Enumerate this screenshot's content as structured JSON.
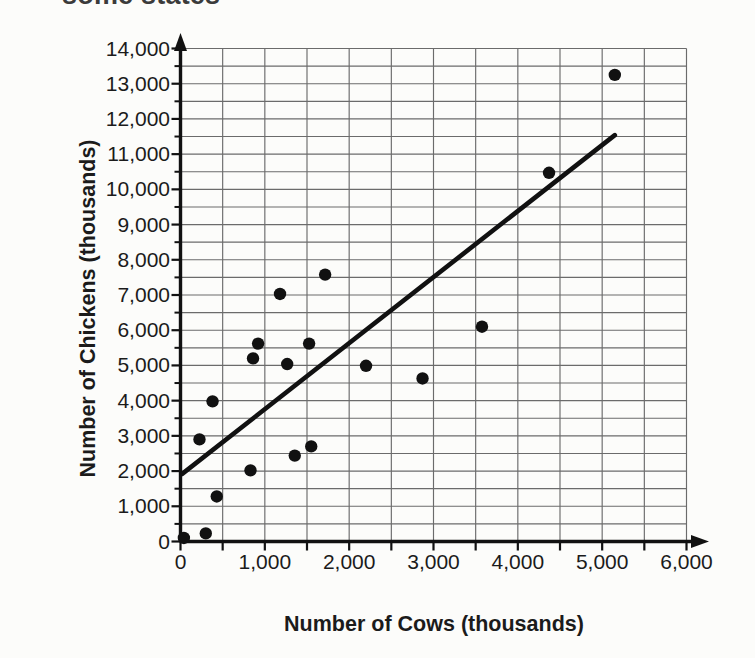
{
  "caption": {
    "text": "some states"
  },
  "chart_data": {
    "type": "scatter",
    "title": "",
    "xlabel": "Number of Cows (thousands)",
    "ylabel": "Number of Chickens (thousands)",
    "xlim": [
      0,
      6000
    ],
    "ylim": [
      0,
      14000
    ],
    "x_major_step": 1000,
    "y_major_step": 1000,
    "x_minor_step": 500,
    "y_minor_step": 500,
    "grid": true,
    "grid_x_step": 500,
    "grid_y_step": 500,
    "legend": "none",
    "x_tick_labels": [
      "0",
      "1,000",
      "2,000",
      "3,000",
      "4,000",
      "5,000",
      "6,000"
    ],
    "x_tick_values": [
      0,
      1000,
      2000,
      3000,
      4000,
      5000,
      6000
    ],
    "y_tick_labels": [
      "0",
      "1,000",
      "2,000",
      "3,000",
      "4,000",
      "5,000",
      "6,000",
      "7,000",
      "8,000",
      "9,000",
      "10,000",
      "11,000",
      "12,000",
      "13,000",
      "14,000"
    ],
    "y_tick_values": [
      0,
      1000,
      2000,
      3000,
      4000,
      5000,
      6000,
      7000,
      8000,
      9000,
      10000,
      11000,
      12000,
      13000,
      14000
    ],
    "points": [
      {
        "x": 40,
        "y": 100
      },
      {
        "x": 300,
        "y": 230
      },
      {
        "x": 225,
        "y": 2900
      },
      {
        "x": 430,
        "y": 1280
      },
      {
        "x": 380,
        "y": 3980
      },
      {
        "x": 830,
        "y": 2020
      },
      {
        "x": 860,
        "y": 5200
      },
      {
        "x": 920,
        "y": 5620
      },
      {
        "x": 1180,
        "y": 7030
      },
      {
        "x": 1265,
        "y": 5040
      },
      {
        "x": 1355,
        "y": 2440
      },
      {
        "x": 1525,
        "y": 5620
      },
      {
        "x": 1550,
        "y": 2700
      },
      {
        "x": 1715,
        "y": 7580
      },
      {
        "x": 2200,
        "y": 4990
      },
      {
        "x": 2870,
        "y": 4630
      },
      {
        "x": 3575,
        "y": 6100
      },
      {
        "x": 4370,
        "y": 10470
      },
      {
        "x": 5150,
        "y": 13250
      }
    ],
    "trend_line": {
      "x1": 20,
      "y1": 1920,
      "x2": 5150,
      "y2": 11540,
      "color": "#111111"
    }
  },
  "style": {
    "axis_color": "#111111",
    "grid_color": "#6b6b6b",
    "point_color": "#111111",
    "background": "#fcfcfa"
  }
}
